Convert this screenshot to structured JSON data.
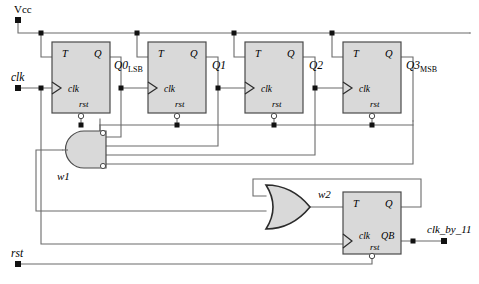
{
  "diagram": {
    "colors": {
      "wire": "#6b6b6b",
      "block_fill": "#d9d9d9",
      "block_stroke": "#4a4a4a",
      "text": "#000000",
      "background": "#ffffff"
    },
    "ports": [
      {
        "id": "vcc",
        "label": "Vcc",
        "x": 18,
        "y": 20,
        "label_x": 14,
        "label_y": 13,
        "italic": false
      },
      {
        "id": "clk",
        "label": "clk",
        "x": 18,
        "y": 88,
        "label_x": 12,
        "label_y": 81,
        "italic": true
      },
      {
        "id": "rst",
        "label": "rst",
        "x": 18,
        "y": 264,
        "label_x": 12,
        "label_y": 257,
        "italic": true
      },
      {
        "id": "clk_by_11",
        "label": "clk_by_11",
        "x": 444,
        "y": 241,
        "label_x": 428,
        "label_y": 232,
        "italic": true
      }
    ],
    "flipflops": [
      {
        "id": "ff0",
        "x": 52,
        "y": 42,
        "w": 58,
        "h": 71,
        "t": "T",
        "q": "Q",
        "clk": "clk",
        "rst": "rst"
      },
      {
        "id": "ff1",
        "x": 148,
        "y": 42,
        "w": 58,
        "h": 71,
        "t": "T",
        "q": "Q",
        "clk": "clk",
        "rst": "rst"
      },
      {
        "id": "ff2",
        "x": 245,
        "y": 42,
        "w": 58,
        "h": 71,
        "t": "T",
        "q": "Q",
        "clk": "clk",
        "rst": "rst"
      },
      {
        "id": "ff3",
        "x": 343,
        "y": 42,
        "w": 58,
        "h": 71,
        "t": "T",
        "q": "Q",
        "clk": "clk",
        "rst": "rst"
      },
      {
        "id": "ff4",
        "x": 343,
        "y": 192,
        "w": 58,
        "h": 62,
        "t": "T",
        "q": "Q",
        "clk": "clk",
        "rst": "rst",
        "qb": "QB"
      }
    ],
    "signal_labels": [
      {
        "id": "q0",
        "base": "Q0",
        "sub": "LSB",
        "x": 114,
        "y": 69
      },
      {
        "id": "q1",
        "base": "Q1",
        "sub": "",
        "x": 212,
        "y": 69
      },
      {
        "id": "q2",
        "base": "Q2",
        "sub": "",
        "x": 309,
        "y": 69
      },
      {
        "id": "q3",
        "base": "Q3",
        "sub": "MSB",
        "x": 406,
        "y": 69
      },
      {
        "id": "w1",
        "base": "w1",
        "sub": "",
        "x": 57,
        "y": 180
      },
      {
        "id": "w2",
        "base": "w2",
        "sub": "",
        "x": 318,
        "y": 198
      }
    ],
    "gates": [
      {
        "id": "and1",
        "type": "and-gate",
        "mirrored": true,
        "x": 62,
        "y": 131,
        "w": 44,
        "h": 37,
        "inputs": 4,
        "bubbles": [
          0,
          3
        ]
      },
      {
        "id": "or1",
        "type": "or-gate",
        "mirrored": false,
        "x": 266,
        "y": 185,
        "w": 44,
        "h": 37,
        "inputs": 2,
        "bubbles": []
      }
    ]
  }
}
